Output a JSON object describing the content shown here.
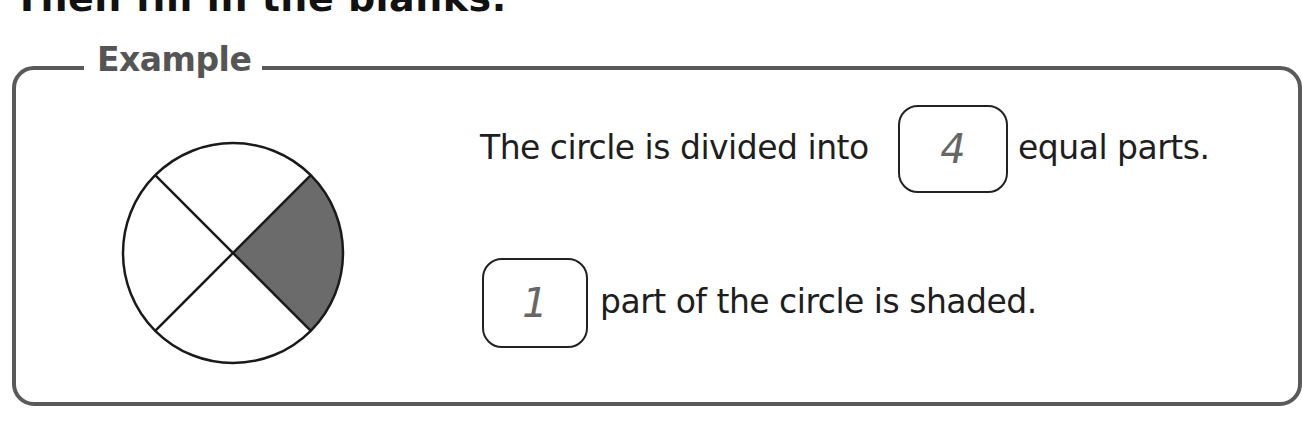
{
  "heading": {
    "text": "Then fill in the blanks."
  },
  "example": {
    "label": "Example",
    "figure": {
      "shape": "circle",
      "parts": 4,
      "shaded_parts": 1,
      "shaded_position": "right",
      "fill_color": "#6b6b6b",
      "stroke_color": "#1a1a1a"
    },
    "sentence1": {
      "before": "The circle is divided into",
      "answer": "4",
      "after": "equal parts."
    },
    "sentence2": {
      "answer": "1",
      "after": "part of the circle is shaded."
    }
  }
}
